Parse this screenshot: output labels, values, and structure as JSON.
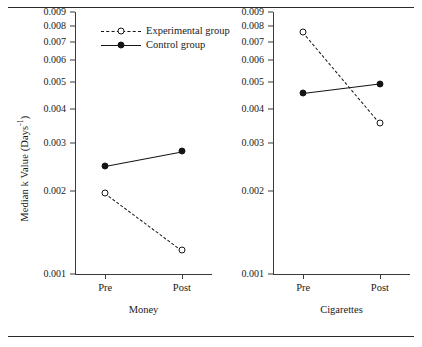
{
  "figure": {
    "ylabel_text": "Median k Value (Days",
    "ylabel_sup": "-1",
    "ylabel_close": ")",
    "ylabel_full": "Median k Value (Days-1)"
  },
  "legend": {
    "position": "top-left-inside-money-panel",
    "items": [
      {
        "label": "Experimental group",
        "marker": "open-circle",
        "line": "dashed"
      },
      {
        "label": "Control group",
        "marker": "filled-circle",
        "line": "solid"
      }
    ]
  },
  "chart_data": {
    "type": "line",
    "title": "",
    "xlabel": "",
    "ylabel": "Median k Value (Days-1)",
    "yscale": "log",
    "ylim": [
      0.001,
      0.009
    ],
    "yticks": [
      0.001,
      0.002,
      0.003,
      0.004,
      0.005,
      0.006,
      0.007,
      0.008,
      0.009
    ],
    "ytick_labels": [
      "0.001",
      "0.002",
      "0.003",
      "0.004",
      "0.005",
      "0.006",
      "0.007",
      "0.008",
      "0.009"
    ],
    "grid": false,
    "legend_position": "upper left",
    "panels": [
      {
        "name": "Money",
        "xlabel": "Money",
        "categories": [
          "Pre",
          "Post"
        ],
        "series": [
          {
            "name": "Experimental group",
            "values": [
              0.00197,
              0.00122
            ],
            "line": "dashed",
            "marker": "open-circle"
          },
          {
            "name": "Control group",
            "values": [
              0.00248,
              0.0028
            ],
            "line": "solid",
            "marker": "filled-circle"
          }
        ]
      },
      {
        "name": "Cigarettes",
        "xlabel": "Cigarettes",
        "categories": [
          "Pre",
          "Post"
        ],
        "series": [
          {
            "name": "Experimental group",
            "values": [
              0.0076,
              0.00355
            ],
            "line": "dashed",
            "marker": "open-circle"
          },
          {
            "name": "Control group",
            "values": [
              0.00455,
              0.00493
            ],
            "line": "solid",
            "marker": "filled-circle"
          }
        ]
      }
    ]
  },
  "colors": {
    "ink": "#151515",
    "axis": "#3a3a3a",
    "rule": "#2b2b2b",
    "background": "#ffffff"
  }
}
